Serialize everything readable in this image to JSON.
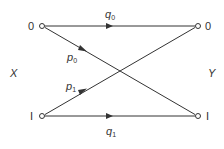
{
  "diagram": {
    "type": "binary-channel",
    "input_label": "X",
    "output_label": "Y",
    "input_nodes": [
      {
        "label": "0",
        "x": 42,
        "y": 26
      },
      {
        "label": "I",
        "x": 42,
        "y": 116
      }
    ],
    "output_nodes": [
      {
        "label": "0",
        "x": 198,
        "y": 26
      },
      {
        "label": "I",
        "x": 198,
        "y": 116
      }
    ],
    "edges": [
      {
        "from": "X0",
        "to": "Y0",
        "label": "q",
        "subscript": "0"
      },
      {
        "from": "X0",
        "to": "Y1",
        "label": "p",
        "subscript": "0"
      },
      {
        "from": "X1",
        "to": "Y0",
        "label": "p",
        "subscript": "1"
      },
      {
        "from": "X1",
        "to": "Y1",
        "label": "q",
        "subscript": "1"
      }
    ],
    "colors": {
      "line": "#333333",
      "background": "#ffffff"
    }
  }
}
